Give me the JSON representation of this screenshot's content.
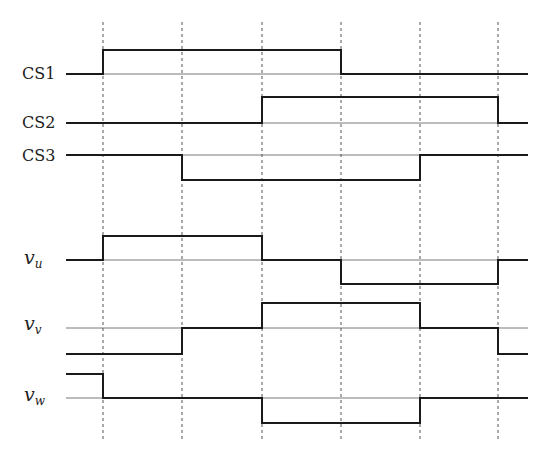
{
  "figure": {
    "type": "timing-diagram",
    "stroke_color": "#1a1a1a",
    "baseline_color": "#555555",
    "dash_color": "#555555",
    "x_start": 66,
    "x_end": 528,
    "dash_top": 22,
    "dash_bottom": 440,
    "transitions_x": [
      103,
      182,
      262,
      341,
      420,
      498
    ]
  },
  "signals": [
    {
      "id": "cs1",
      "label": "CS1",
      "label_pos": [
        22,
        66
      ],
      "baseline_y": 74,
      "levels_y": {
        "high": 50,
        "zero": 74
      },
      "segments": [
        "zero",
        "high",
        "high",
        "high",
        "zero",
        "zero",
        "zero"
      ]
    },
    {
      "id": "cs2",
      "label": "CS2",
      "label_pos": [
        22,
        115
      ],
      "baseline_y": 123,
      "levels_y": {
        "high": 97,
        "zero": 123
      },
      "segments": [
        "zero",
        "zero",
        "zero",
        "high",
        "high",
        "high",
        "zero"
      ]
    },
    {
      "id": "cs3",
      "label": "CS3",
      "label_pos": [
        22,
        148
      ],
      "baseline_y": 155,
      "levels_y": {
        "zero": 155,
        "low": 180
      },
      "segments": [
        "zero",
        "zero",
        "low",
        "low",
        "low",
        "zero",
        "zero"
      ]
    },
    {
      "id": "vu",
      "label": "v",
      "label_sub": "u",
      "label_pos": [
        24,
        252
      ],
      "baseline_y": 260,
      "levels_y": {
        "high": 236,
        "zero": 260,
        "low": 284
      },
      "segments": [
        "zero",
        "high",
        "high",
        "zero",
        "low",
        "low",
        "zero"
      ]
    },
    {
      "id": "vv",
      "label": "v",
      "label_sub": "v",
      "label_pos": [
        24,
        318
      ],
      "baseline_y": 328,
      "levels_y": {
        "high": 303,
        "zero": 328,
        "low": 354
      },
      "segments": [
        "low",
        "low",
        "zero",
        "high",
        "high",
        "zero",
        "low"
      ]
    },
    {
      "id": "vw",
      "label": "v",
      "label_sub": "w",
      "label_pos": [
        24,
        389
      ],
      "baseline_y": 398,
      "levels_y": {
        "high": 374,
        "zero": 398,
        "low": 423
      },
      "segments": [
        "high",
        "zero",
        "zero",
        "low",
        "low",
        "zero",
        "zero"
      ]
    }
  ]
}
